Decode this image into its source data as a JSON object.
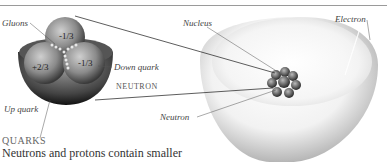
{
  "labels": {
    "gluons": "Gluons",
    "down_quark": "Down quark",
    "neutron_caps": "NEUTRON",
    "up_quark": "Up quark",
    "nucleus": "Nucleus",
    "electron": "Electron",
    "neutron": "Neutron"
  },
  "quark_charges": {
    "top": "-1/3",
    "left": "+2/3",
    "right": "-1/3"
  },
  "caption": {
    "title": "QUARKS",
    "text": "Neutrons and protons contain smaller"
  }
}
